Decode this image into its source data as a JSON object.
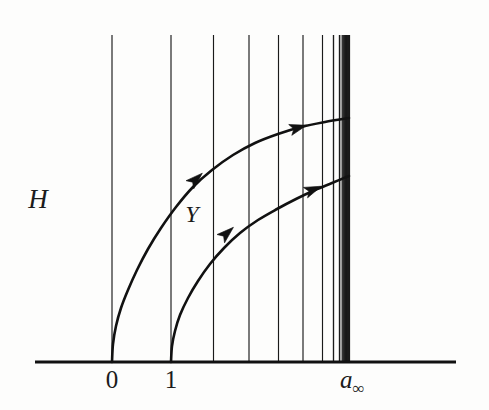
{
  "figure": {
    "title": "H",
    "kind": "diagram",
    "background_color": "#fdfdfc",
    "ink_color": "#111111",
    "axis": {
      "name": "horizontal-baseline",
      "x_start": 35,
      "x_end": 456,
      "y": 362,
      "thickness": 3.2
    },
    "labels": {
      "vertical_axis_label": "H",
      "flow_label": "Y",
      "tick_zero": "0",
      "tick_one": "1",
      "tick_limit_base": "a",
      "tick_limit_sub": "∞"
    },
    "label_positions": {
      "H": {
        "x": 38,
        "y": 208
      },
      "Y": {
        "x": 192,
        "y": 222
      },
      "zero": {
        "x": 112,
        "y": 388
      },
      "one": {
        "x": 171,
        "y": 388
      },
      "a_infty": {
        "x": 340,
        "y": 388
      }
    }
  },
  "chart_data": {
    "type": "line",
    "title": "",
    "xlabel": "",
    "ylabel": "H",
    "xlim": [
      35,
      456
    ],
    "ylim": [
      35,
      362
    ],
    "grid": false,
    "legend": "none",
    "axis_tick_labels": [
      "0",
      "1",
      "a∞"
    ],
    "fiber_lines": {
      "name": "vertical-fibers",
      "y_top": 35,
      "y_bottom": 362,
      "x_positions": [
        112,
        171,
        213.5,
        249,
        278.5,
        303,
        322.5,
        333.5,
        339.5,
        343.0,
        345.0,
        346.2,
        346.9,
        347.3,
        347.6,
        347.8,
        347.95,
        348.05
      ],
      "accumulation_band": {
        "x_start": 340,
        "x_end": 349,
        "fill": "#1a1a1a"
      },
      "accumulation_point_x": 348
    },
    "curves": [
      {
        "name": "upper-flow-curve",
        "start": {
          "x": 112,
          "y": 362
        },
        "end": {
          "x": 349,
          "y": 118
        },
        "points": [
          [
            112,
            362
          ],
          [
            113,
            344
          ],
          [
            116,
            326
          ],
          [
            121,
            308
          ],
          [
            128,
            290
          ],
          [
            137,
            270
          ],
          [
            148,
            249
          ],
          [
            161,
            228
          ],
          [
            176,
            207
          ],
          [
            193,
            187
          ],
          [
            212,
            170
          ],
          [
            233,
            155
          ],
          [
            255,
            143
          ],
          [
            278,
            134
          ],
          [
            301,
            127
          ],
          [
            325,
            122
          ],
          [
            349,
            118
          ]
        ],
        "arrows": [
          {
            "x": 195,
            "y": 180,
            "angle_deg": -43
          },
          {
            "x": 297,
            "y": 128,
            "angle_deg": -16
          }
        ]
      },
      {
        "name": "lower-flow-curve",
        "start": {
          "x": 171,
          "y": 362
        },
        "end": {
          "x": 349,
          "y": 176
        },
        "points": [
          [
            171,
            362
          ],
          [
            172,
            346
          ],
          [
            175,
            331
          ],
          [
            180,
            315
          ],
          [
            188,
            298
          ],
          [
            198,
            281
          ],
          [
            210,
            264
          ],
          [
            224,
            248
          ],
          [
            240,
            233
          ],
          [
            258,
            220
          ],
          [
            277,
            209
          ],
          [
            296,
            199
          ],
          [
            315,
            190
          ],
          [
            332,
            183
          ],
          [
            349,
            176
          ]
        ],
        "arrows": [
          {
            "x": 226,
            "y": 234,
            "angle_deg": -42
          },
          {
            "x": 312,
            "y": 190,
            "angle_deg": -22
          }
        ]
      }
    ]
  }
}
